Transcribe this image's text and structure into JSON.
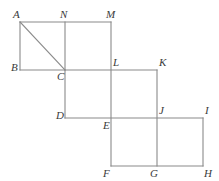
{
  "figure": {
    "type": "geometric-diagram",
    "canvas": {
      "width": 219,
      "height": 181
    },
    "stroke_color": "#8a8a8a",
    "label_color": "#3a3a3a",
    "background_color": "#ffffff",
    "vertices": [
      {
        "id": "A",
        "label": "A",
        "x": 20,
        "y": 22,
        "label_x": 13,
        "label_y": 9
      },
      {
        "id": "N",
        "label": "N",
        "x": 65,
        "y": 22,
        "label_x": 60,
        "label_y": 9
      },
      {
        "id": "M",
        "label": "M",
        "x": 111,
        "y": 22,
        "label_x": 106,
        "label_y": 9
      },
      {
        "id": "B",
        "label": "B",
        "x": 20,
        "y": 70,
        "label_x": 11,
        "label_y": 62
      },
      {
        "id": "C",
        "label": "C",
        "x": 65,
        "y": 70,
        "label_x": 57,
        "label_y": 71
      },
      {
        "id": "L",
        "label": "L",
        "x": 111,
        "y": 70,
        "label_x": 113,
        "label_y": 57
      },
      {
        "id": "K",
        "label": "K",
        "x": 157,
        "y": 70,
        "label_x": 159,
        "label_y": 57
      },
      {
        "id": "D",
        "label": "D",
        "x": 65,
        "y": 118,
        "label_x": 56,
        "label_y": 110
      },
      {
        "id": "E",
        "label": "E",
        "x": 111,
        "y": 118,
        "label_x": 103,
        "label_y": 120
      },
      {
        "id": "J",
        "label": "J",
        "x": 157,
        "y": 118,
        "label_x": 159,
        "label_y": 105
      },
      {
        "id": "I",
        "label": "I",
        "x": 203,
        "y": 118,
        "label_x": 205,
        "label_y": 105
      },
      {
        "id": "F",
        "label": "F",
        "x": 111,
        "y": 166,
        "label_x": 103,
        "label_y": 168
      },
      {
        "id": "G",
        "label": "G",
        "x": 157,
        "y": 166,
        "label_x": 150,
        "label_y": 168
      },
      {
        "id": "H",
        "label": "H",
        "x": 203,
        "y": 166,
        "label_x": 204,
        "label_y": 168
      }
    ],
    "edges": [
      {
        "name": "edge-A-N-M-top",
        "from": "A",
        "to": "M",
        "x1": 20,
        "y1": 22,
        "x2": 111,
        "y2": 22
      },
      {
        "name": "edge-A-B-left",
        "from": "A",
        "to": "B",
        "x1": 20,
        "y1": 22,
        "x2": 20,
        "y2": 70
      },
      {
        "name": "edge-B-C-L-K",
        "from": "B",
        "to": "K",
        "x1": 20,
        "y1": 70,
        "x2": 157,
        "y2": 70
      },
      {
        "name": "edge-N-C-vertical",
        "from": "N",
        "to": "C",
        "x1": 65,
        "y1": 22,
        "x2": 65,
        "y2": 70
      },
      {
        "name": "edge-C-D-vertical",
        "from": "C",
        "to": "D",
        "x1": 65,
        "y1": 70,
        "x2": 65,
        "y2": 118
      },
      {
        "name": "edge-M-L-E-F",
        "from": "M",
        "to": "F",
        "x1": 111,
        "y1": 22,
        "x2": 111,
        "y2": 166
      },
      {
        "name": "edge-K-J-G",
        "from": "K",
        "to": "G",
        "x1": 157,
        "y1": 70,
        "x2": 157,
        "y2": 166
      },
      {
        "name": "edge-D-E-J-I",
        "from": "D",
        "to": "I",
        "x1": 65,
        "y1": 118,
        "x2": 203,
        "y2": 118
      },
      {
        "name": "edge-I-H-right",
        "from": "I",
        "to": "H",
        "x1": 203,
        "y1": 118,
        "x2": 203,
        "y2": 166
      },
      {
        "name": "edge-F-G-H-bottom",
        "from": "F",
        "to": "H",
        "x1": 111,
        "y1": 166,
        "x2": 203,
        "y2": 166
      }
    ],
    "diagonals": [
      {
        "name": "diagonal-A-C",
        "from": "A",
        "to": "C",
        "x1": 20,
        "y1": 22,
        "x2": 65,
        "y2": 70
      }
    ]
  }
}
